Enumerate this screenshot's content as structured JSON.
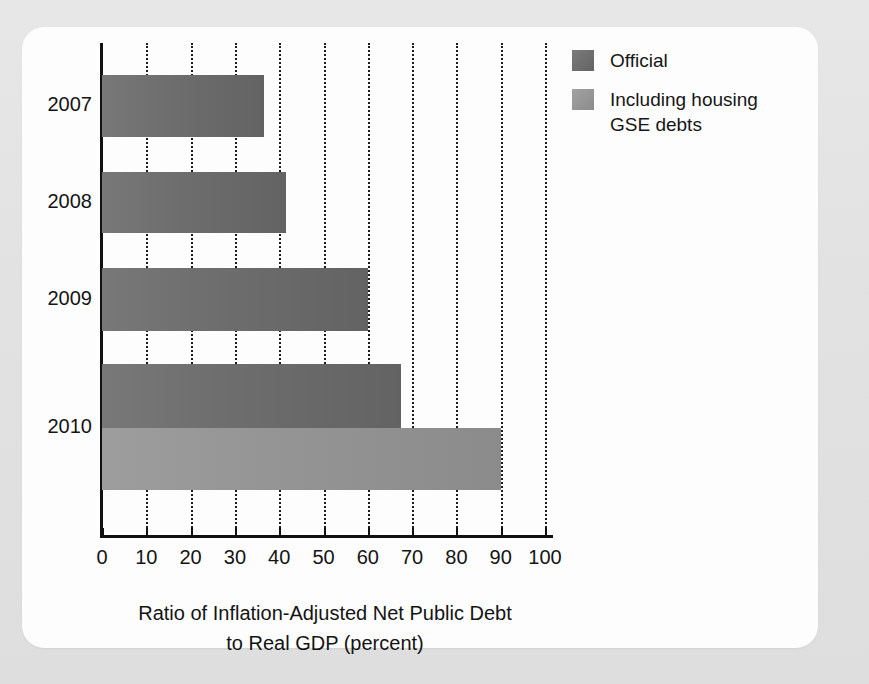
{
  "chart_data": {
    "type": "bar",
    "orientation": "horizontal",
    "title": "",
    "xlabel": "Ratio of Inflation-Adjusted Net Public Debt to Real GDP (percent)",
    "xlabel_lines": [
      "Ratio of Inflation-Adjusted Net Public Debt",
      "to Real GDP (percent)"
    ],
    "ylabel": "",
    "categories": [
      "2007",
      "2008",
      "2009",
      "2010"
    ],
    "xlim": [
      0,
      100
    ],
    "xticks": [
      0,
      10,
      20,
      30,
      40,
      50,
      60,
      70,
      80,
      90,
      100
    ],
    "xticklabels": [
      "0",
      "10",
      "20",
      "30",
      "40",
      "50",
      "60",
      "70",
      "80",
      "90",
      "100"
    ],
    "grid": "vertical-dotted",
    "legend_position": "top-right",
    "series": [
      {
        "name": "Official",
        "color": "#6f6f6f",
        "values": [
          36.5,
          41.5,
          60.0,
          67.5
        ]
      },
      {
        "name": "Including housing GSE debts",
        "color": "#959595",
        "values": [
          null,
          null,
          null,
          90.0
        ]
      }
    ],
    "bars": [
      {
        "category": "2007",
        "series": "Official",
        "value": 36.5
      },
      {
        "category": "2008",
        "series": "Official",
        "value": 41.5
      },
      {
        "category": "2009",
        "series": "Official",
        "value": 60.0
      },
      {
        "category": "2010",
        "series": "Official",
        "value": 67.5
      },
      {
        "category": "2010",
        "series": "Including housing GSE debts",
        "value": 90.0
      }
    ]
  },
  "legend": {
    "entries": [
      {
        "label": "Official",
        "swatch": "official"
      },
      {
        "label": "Including housing GSE debts",
        "swatch": "gse"
      }
    ]
  },
  "axis": {
    "x_title_line1": "Ratio of Inflation-Adjusted Net Public Debt",
    "x_title_line2": "to Real GDP (percent)"
  },
  "colors": {
    "official": "#6f6f6f",
    "gse": "#959595",
    "axis": "#111111",
    "card": "#fdfdfd",
    "backdrop": "#e4e4e4"
  }
}
